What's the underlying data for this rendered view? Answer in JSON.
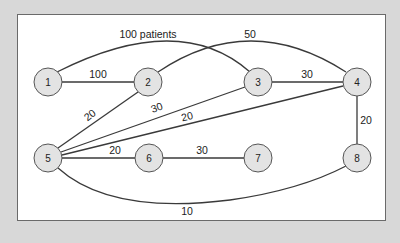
{
  "diagram": {
    "type": "weighted-network-graph",
    "colors": {
      "background": "#d8d8d8",
      "panel": "#ffffff",
      "node_fill": "#e3e3e3",
      "node_stroke": "#555555",
      "edge": "#3a3a3a"
    },
    "nodes": [
      {
        "id": "1",
        "label": "1"
      },
      {
        "id": "2",
        "label": "2"
      },
      {
        "id": "3",
        "label": "3"
      },
      {
        "id": "4",
        "label": "4"
      },
      {
        "id": "5",
        "label": "5"
      },
      {
        "id": "6",
        "label": "6"
      },
      {
        "id": "7",
        "label": "7"
      },
      {
        "id": "8",
        "label": "8"
      }
    ],
    "edges": [
      {
        "from": "1",
        "to": "3",
        "label": "100 patients"
      },
      {
        "from": "1",
        "to": "2",
        "label": "100"
      },
      {
        "from": "2",
        "to": "4",
        "label": "50"
      },
      {
        "from": "3",
        "to": "4",
        "label": "30"
      },
      {
        "from": "5",
        "to": "2",
        "label": "20"
      },
      {
        "from": "5",
        "to": "3",
        "label": "30"
      },
      {
        "from": "5",
        "to": "4",
        "label": "20"
      },
      {
        "from": "4",
        "to": "8",
        "label": "20"
      },
      {
        "from": "5",
        "to": "6",
        "label": "20"
      },
      {
        "from": "6",
        "to": "7",
        "label": "30"
      },
      {
        "from": "5",
        "to": "8",
        "label": "10"
      }
    ]
  }
}
